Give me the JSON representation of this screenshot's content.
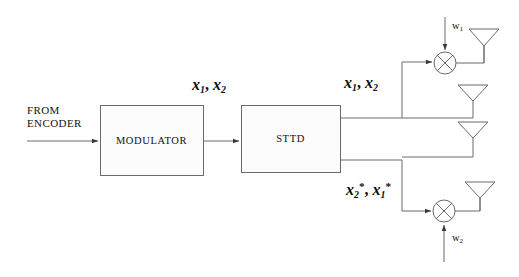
{
  "figure": {
    "type": "block-diagram",
    "background": "#ffffff",
    "line_color": "#555555",
    "text_color": "#111111"
  },
  "labels": {
    "from_encoder_line1": "FROM",
    "from_encoder_line2": "ENCODER",
    "modulator": "MODULATOR",
    "sttd": "STTD",
    "mod_output_symbols": "x₁, x₂",
    "sttd_output_top_symbols": "x₁, x₂",
    "sttd_output_bottom_symbols": "x₂*, x₁*",
    "weight_top": "w₁",
    "weight_bottom": "w₂"
  },
  "symbols": {
    "x1": "x",
    "x1_sub": "1",
    "x2": "x",
    "x2_sub": "2",
    "comma": ",",
    "star": "*",
    "w": "w",
    "w1_sub": "1",
    "w2_sub": "2"
  },
  "blocks": [
    {
      "id": "modulator",
      "label": "MODULATOR",
      "x": 100,
      "y": 105,
      "w": 103,
      "h": 70
    },
    {
      "id": "sttd",
      "label": "STTD",
      "x": 241,
      "y": 105,
      "w": 99,
      "h": 67
    }
  ],
  "multipliers": [
    {
      "id": "mult-top",
      "label": "multiplier",
      "cx": 445,
      "cy": 63,
      "r": 11
    },
    {
      "id": "mult-bottom",
      "label": "multiplier",
      "cx": 444,
      "cy": 211,
      "r": 11
    }
  ],
  "antennas": [
    {
      "id": "antenna-1",
      "index": 1,
      "cx": 484,
      "apex_y": 29,
      "base_y": 46,
      "stem_y": 62
    },
    {
      "id": "antenna-2",
      "index": 2,
      "cx": 473,
      "apex_y": 85,
      "base_y": 101,
      "stem_y": 118
    },
    {
      "id": "antenna-3",
      "index": 3,
      "cx": 473,
      "apex_y": 122,
      "base_y": 138,
      "stem_y": 157
    },
    {
      "id": "antenna-4",
      "index": 4,
      "cx": 480,
      "apex_y": 182,
      "base_y": 198,
      "stem_y": 211
    }
  ]
}
